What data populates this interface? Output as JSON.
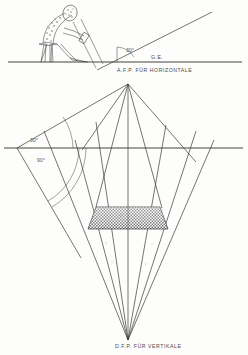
{
  "document": {
    "kind": "technical-drawing",
    "subject": "perspective-construction",
    "background_color": "#fdfdfc",
    "ink_color": "#3a3a3a"
  },
  "labels": {
    "ground_edge": "G.E.",
    "horizontal_vp": "A.F.P. FÜR HORIZONTALE",
    "vertical_vp": "D.F.P. FÜR VERTIKALE",
    "angle_top": "30°",
    "angle_horizon": "30°",
    "angle_right": "90°"
  },
  "upper_scene": {
    "name": "draftsman-at-easel",
    "ground_line_y": 62,
    "sight_ray_angle": "30°",
    "angle_label": "30°",
    "ground_label": "G.E."
  },
  "lower_scene": {
    "name": "perspective-cone-construction",
    "horizon_y": 148,
    "apex_label": "A.F.P. FÜR HORIZONTALE",
    "vanishing_point_label": "D.F.P. FÜR VERTIKALE",
    "angle_upper": "30°",
    "angle_lower": "90°",
    "object_shape": "hatched-trapezoid"
  },
  "geometry": {
    "ground_line": {
      "x1": 8,
      "y1": 62,
      "x2": 240,
      "y2": 62
    },
    "horizon_line": {
      "x1": 4,
      "y1": 148,
      "x2": 243,
      "y2": 148
    },
    "afp_point": {
      "x": 128,
      "y": 84
    },
    "dfp_point": {
      "x": 128,
      "y": 340
    },
    "angle_vertex": {
      "x": 17,
      "y": 148
    },
    "trapezoid": {
      "top_left": {
        "x": 96,
        "y": 207
      },
      "top_right": {
        "x": 160,
        "y": 207
      },
      "bottom_right": {
        "x": 168,
        "y": 229
      },
      "bottom_left": {
        "x": 88,
        "y": 229
      }
    }
  },
  "colors": {
    "ink": "#3a3a3a",
    "label": "#4a4a4a",
    "paper": "#fdfdfc",
    "hatch": "#6f6f6f"
  }
}
